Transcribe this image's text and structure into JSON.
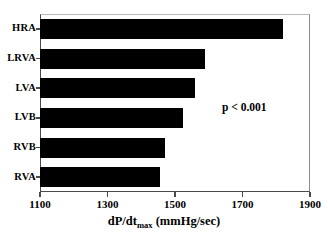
{
  "chart_data": {
    "type": "bar",
    "orientation": "horizontal",
    "title": "",
    "xlabel": "dP/dtmax (mmHg/sec)",
    "xlabel_parts": {
      "pre": "dP/dt",
      "sub": "max",
      "post": " (mmHg/sec)"
    },
    "ylabel": "",
    "categories": [
      "HRA",
      "LRVA",
      "LVA",
      "LVB",
      "RVB",
      "RVA"
    ],
    "values": [
      1820,
      1589,
      1559,
      1524,
      1470,
      1456
    ],
    "xlim": [
      1100,
      1900
    ],
    "xticks": [
      1100,
      1300,
      1500,
      1700,
      1900
    ],
    "xtick_labels": [
      "1100",
      "1300",
      "1500",
      "1700",
      "1900"
    ],
    "grid": false,
    "legend": false,
    "bar_color": "#000000",
    "annotations": [
      {
        "text": "p < 0.001",
        "x": 1760,
        "y": "LVB"
      }
    ]
  },
  "annotation": {
    "pvalue": "p < 0.001"
  }
}
